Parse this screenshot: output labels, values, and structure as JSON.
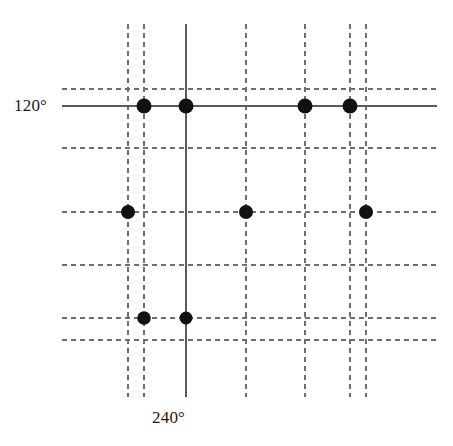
{
  "figure": {
    "title": "",
    "background_color": "#ffffff",
    "width": 453,
    "height": 446,
    "labels": {
      "left_axis": "120°",
      "bottom_axis": "240°"
    },
    "colors": {
      "line": "#6e6e6e",
      "solid_line": "#5a5a5a",
      "marker": "#111111",
      "text": "#1a1a1a"
    }
  },
  "chart_data": {
    "type": "scatter",
    "title": "",
    "xlabel": "240°",
    "ylabel": "120°",
    "grid": true,
    "legend": null,
    "xlim": [
      100,
      440
    ],
    "ylim": [
      60,
      400
    ],
    "annotations": [
      {
        "text": "120°",
        "x": 14,
        "y": 105,
        "role": "horizontal-axis-label"
      },
      {
        "text": "240°",
        "x": 186,
        "y": 418,
        "role": "vertical-axis-label"
      }
    ],
    "gridlines": {
      "vertical": [
        {
          "x": 128,
          "style": "dashed"
        },
        {
          "x": 144,
          "style": "dashed"
        },
        {
          "x": 186,
          "style": "solid"
        },
        {
          "x": 246,
          "style": "dashed"
        },
        {
          "x": 305,
          "style": "dashed"
        },
        {
          "x": 350,
          "style": "dashed"
        },
        {
          "x": 366,
          "style": "dashed"
        }
      ],
      "horizontal": [
        {
          "y": 89,
          "style": "dashed"
        },
        {
          "y": 106,
          "style": "solid"
        },
        {
          "y": 148,
          "style": "dashed"
        },
        {
          "y": 212,
          "style": "dashed"
        },
        {
          "y": 265,
          "style": "dashed"
        },
        {
          "y": 318,
          "style": "dashed"
        },
        {
          "y": 340,
          "style": "dashed"
        }
      ]
    },
    "points": [
      {
        "x": 144,
        "y": 106,
        "r": 7.5,
        "shape": "circle"
      },
      {
        "x": 186,
        "y": 106,
        "r": 7.5,
        "shape": "circle"
      },
      {
        "x": 305,
        "y": 106,
        "r": 7.5,
        "shape": "circle"
      },
      {
        "x": 350,
        "y": 106,
        "r": 7.5,
        "shape": "circle"
      },
      {
        "x": 128,
        "y": 212,
        "r": 7.0,
        "shape": "circle"
      },
      {
        "x": 246,
        "y": 212,
        "r": 7.0,
        "shape": "circle"
      },
      {
        "x": 366,
        "y": 212,
        "r": 7.0,
        "shape": "circle"
      },
      {
        "x": 144,
        "y": 318,
        "r": 6.8,
        "shape": "circle"
      },
      {
        "x": 186,
        "y": 318,
        "r": 6.5,
        "shape": "circle"
      }
    ],
    "extents": {
      "vertical_line_top": 24,
      "vertical_line_bottom": 397,
      "horizontal_line_left": 62,
      "horizontal_line_right": 437,
      "solid_horizontal_left": 62,
      "solid_horizontal_right": 437,
      "solid_vertical_top": 24,
      "solid_vertical_bottom": 397
    }
  }
}
